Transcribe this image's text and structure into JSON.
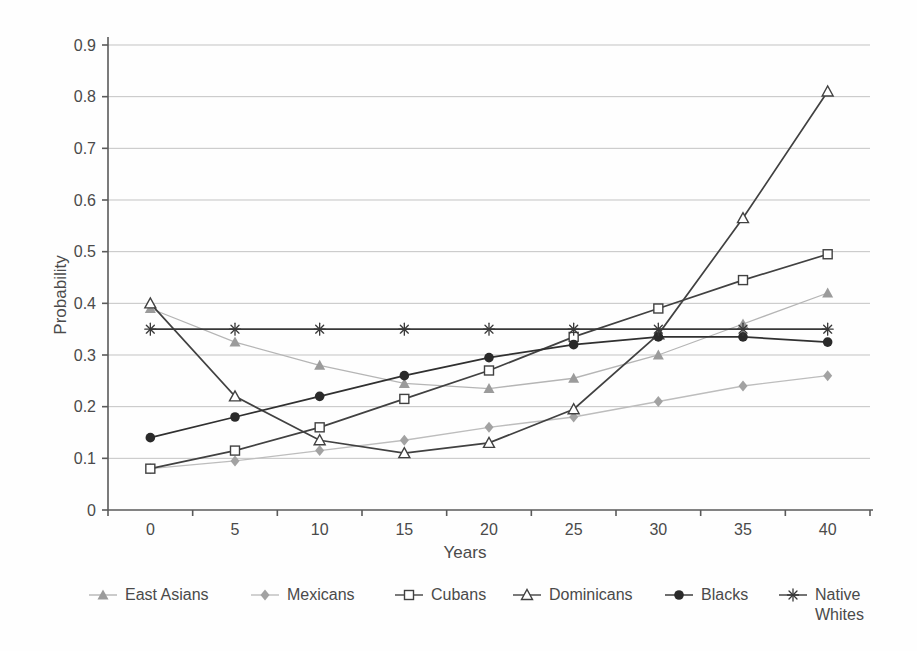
{
  "chart_data": {
    "type": "line",
    "title": "",
    "xlabel": "Years",
    "ylabel": "Probability",
    "x": [
      0,
      5,
      10,
      15,
      20,
      25,
      30,
      35,
      40
    ],
    "xtick_labels": [
      "0",
      "5",
      "10",
      "15",
      "20",
      "25",
      "30",
      "35",
      "40"
    ],
    "xlim": [
      -2.5,
      42.5
    ],
    "ylim": [
      0,
      0.9
    ],
    "ytick_values": [
      0,
      0.1,
      0.2,
      0.3,
      0.4,
      0.5,
      0.6,
      0.7,
      0.8,
      0.9
    ],
    "ytick_labels": [
      "0",
      "0.1",
      "0.2",
      "0.3",
      "0.4",
      "0.5",
      "0.6",
      "0.7",
      "0.8",
      "0.9"
    ],
    "grid": "horizontal-only",
    "legend_position": "bottom",
    "colors": {
      "axis": "#5a5a5a",
      "gridline": "#c3c3c3",
      "text": "#4a4a4a",
      "gray_series_line": "#b5b5b5",
      "gray_series_marker": "#9b9b9b",
      "dark_series": "#3c3c3c",
      "black_series": "#2e2e2e"
    },
    "series": [
      {
        "name": "East Asians",
        "marker": "filled-triangle",
        "line_color": "#b5b5b5",
        "marker_color": "#9b9b9b",
        "values": [
          0.39,
          0.325,
          0.28,
          0.245,
          0.235,
          0.255,
          0.3,
          0.36,
          0.42
        ]
      },
      {
        "name": "Mexicans",
        "marker": "filled-diamond",
        "line_color": "#bdbdbd",
        "marker_color": "#a2a2a2",
        "values": [
          0.08,
          0.095,
          0.115,
          0.135,
          0.16,
          0.18,
          0.21,
          0.24,
          0.26
        ]
      },
      {
        "name": "Cubans",
        "marker": "open-square",
        "line_color": "#414141",
        "marker_color": "#414141",
        "values": [
          0.08,
          0.115,
          0.16,
          0.215,
          0.27,
          0.335,
          0.39,
          0.445,
          0.495
        ]
      },
      {
        "name": "Dominicans",
        "marker": "open-triangle",
        "line_color": "#414141",
        "marker_color": "#414141",
        "values": [
          0.4,
          0.22,
          0.135,
          0.11,
          0.13,
          0.195,
          0.34,
          0.565,
          0.81
        ]
      },
      {
        "name": "Blacks",
        "marker": "filled-circle",
        "line_color": "#303030",
        "marker_color": "#2a2a2a",
        "values": [
          0.14,
          0.18,
          0.22,
          0.26,
          0.295,
          0.32,
          0.335,
          0.335,
          0.325
        ]
      },
      {
        "name": "Native Whites",
        "marker": "asterisk",
        "line_color": "#383838",
        "marker_color": "#383838",
        "values": [
          0.35,
          0.35,
          0.35,
          0.35,
          0.35,
          0.35,
          0.35,
          0.35,
          0.35
        ]
      }
    ]
  }
}
